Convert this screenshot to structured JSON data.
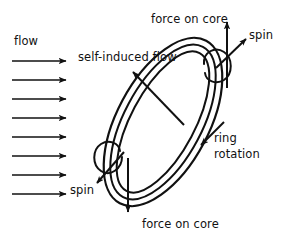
{
  "figure": {
    "background_color": "#ffffff",
    "ink_color": "#111111",
    "width": 282,
    "height": 241
  },
  "labels": {
    "flow": "flow",
    "self_induced_flow": "self-induced flow",
    "force_on_core_top": "force on core",
    "spin_top": "spin",
    "ring_rotation": "ring\nrotation",
    "ring_rotation_line1": "ring",
    "ring_rotation_line2": "rotation",
    "spin_bottom": "spin",
    "force_on_core_bottom": "force on core"
  },
  "flow_field": {
    "arrow_count": 8,
    "direction": "left-to-right",
    "x_start": 12,
    "x_end": 70,
    "y_first": 61,
    "y_spacing": 19
  },
  "ring": {
    "shape": "tilted-ellipse-tube",
    "tilt_degrees": 30,
    "tube_line_count": 3,
    "center_x": 163,
    "center_y": 122,
    "semi_major": 86,
    "semi_minor": 40
  },
  "vectors": {
    "self_induced_flow": {
      "from": [
        183,
        124
      ],
      "to": [
        130,
        69
      ],
      "style": "straight-arrow"
    },
    "force_on_core_top": {
      "from": [
        227,
        86
      ],
      "to": [
        227,
        24
      ],
      "style": "straight-arrow"
    },
    "force_on_core_bottom": {
      "from": [
        128,
        160
      ],
      "to": [
        128,
        214
      ],
      "style": "straight-arrow"
    },
    "spin_top": {
      "from": [
        218,
        66
      ],
      "to": [
        248,
        38
      ],
      "style": "straight-arrow"
    },
    "spin_bottom": {
      "from": [
        128,
        150
      ],
      "to": [
        98,
        184
      ],
      "style": "curl-arrow"
    },
    "ring_rotation": {
      "at": [
        205,
        140
      ],
      "style": "arrowhead-on-ring",
      "direction": "down-left"
    }
  },
  "colors": {
    "ink": "#111111",
    "paper": "#ffffff"
  }
}
